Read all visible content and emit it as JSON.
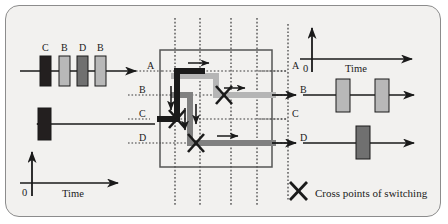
{
  "figure": {
    "type": "switch-fabric-timing-diagram",
    "legend": {
      "icon": "cross-icon",
      "label": "Cross points of switching"
    },
    "colors": {
      "background": "#f2f1ef",
      "border": "#8c8c8c",
      "line": "#1a1a1a",
      "cell_dark": "#231f1f",
      "cell_mid": "#707070",
      "cell_light": "#b8b8b8",
      "path_dark": "#1a1a1a",
      "path_mid": "#808080",
      "path_light": "#b5b5b5",
      "grid_dotted": "#3a3a3a"
    }
  },
  "input_left": {
    "axis": {
      "origin_label": "0",
      "time_label": "Time"
    },
    "line_top": {
      "name": "input-line-a",
      "direction": "right",
      "cells": [
        {
          "label": "C",
          "shade": "cell_dark"
        },
        {
          "label": "B",
          "shade": "cell_light"
        },
        {
          "label": "D",
          "shade": "cell_mid"
        },
        {
          "label": "B",
          "shade": "cell_light"
        }
      ]
    },
    "line_bottom": {
      "name": "input-line-c",
      "direction": "left",
      "cells": [
        {
          "label": "",
          "shade": "cell_dark"
        }
      ]
    }
  },
  "switch": {
    "name": "switch-fabric",
    "input_ports": [
      "A",
      "B",
      "C",
      "D"
    ],
    "output_ports": [
      "A",
      "B",
      "C",
      "D"
    ],
    "grid_columns": 4,
    "grid_rows": 4,
    "cross_points": [
      {
        "row": "B",
        "column": 3
      },
      {
        "row": "C",
        "column": 1
      },
      {
        "row": "D",
        "column": 2
      }
    ],
    "paths": [
      {
        "name": "path-a-to-c",
        "shade": "path_dark",
        "from": "A",
        "to": "C"
      },
      {
        "name": "path-b-to-b",
        "shade": "path_light",
        "from": "B",
        "to": "B"
      },
      {
        "name": "path-b-to-d",
        "shade": "path_mid",
        "from": "B",
        "to": "D"
      }
    ]
  },
  "output_right": {
    "axis": {
      "origin_label": "0",
      "time_label": "Time"
    },
    "line_b": {
      "name": "output-line-b",
      "direction": "right",
      "cells": [
        {
          "label": "",
          "shade": "cell_light"
        },
        {
          "label": "",
          "shade": "cell_light"
        }
      ]
    },
    "line_d": {
      "name": "output-line-d",
      "direction": "right",
      "cells": [
        {
          "label": "",
          "shade": "cell_mid"
        }
      ]
    }
  }
}
